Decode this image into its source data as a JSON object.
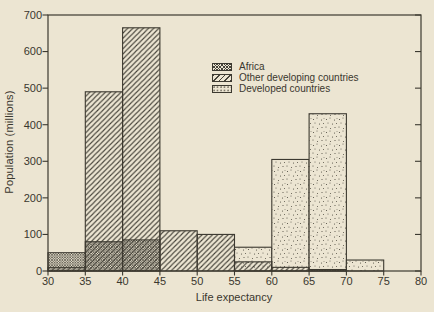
{
  "figure": {
    "background_color": "#ece5d2",
    "ink_color": "#3c3930",
    "pattern_color": "#46433a"
  },
  "chart_data": {
    "type": "bar",
    "subtype": "stepped-histogram",
    "title": "",
    "xlabel": "Life expectancy",
    "ylabel": "Population (millions)",
    "xlim": [
      30,
      80
    ],
    "ylim": [
      0,
      700
    ],
    "x_ticks": [
      30,
      35,
      40,
      45,
      50,
      55,
      60,
      65,
      70,
      75,
      80
    ],
    "y_ticks": [
      0,
      100,
      200,
      300,
      400,
      500,
      600,
      700
    ],
    "bin_width": 5,
    "grid": false,
    "legend_position": "upper-middle-left-inside",
    "series": [
      {
        "name": "Africa",
        "pattern": "crosshatch",
        "bins": [
          [
            30,
            50
          ],
          [
            35,
            80
          ],
          [
            40,
            85
          ],
          [
            65,
            4
          ]
        ]
      },
      {
        "name": "Other developing countries",
        "pattern": "hatch",
        "bins": [
          [
            30,
            10
          ],
          [
            35,
            490
          ],
          [
            40,
            665
          ],
          [
            45,
            110
          ],
          [
            50,
            100
          ],
          [
            55,
            25
          ],
          [
            60,
            10
          ]
        ]
      },
      {
        "name": "Developed countries",
        "pattern": "stipple",
        "bins": [
          [
            55,
            65
          ],
          [
            60,
            305
          ],
          [
            65,
            430
          ],
          [
            70,
            30
          ]
        ]
      }
    ]
  },
  "legend": {
    "items": [
      {
        "label": "Africa",
        "pattern": "crosshatch"
      },
      {
        "label": "Other developing countries",
        "pattern": "hatch"
      },
      {
        "label": "Developed countries",
        "pattern": "stipple"
      }
    ]
  }
}
